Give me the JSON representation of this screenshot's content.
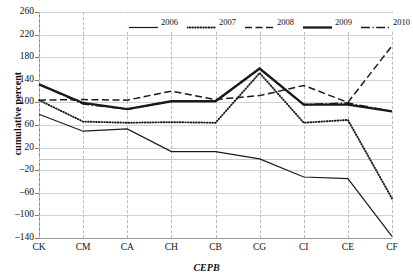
{
  "chart_data": {
    "type": "line",
    "title": "",
    "xlabel": "CEPB",
    "ylabel": "cumulative percent",
    "categories": [
      "CK",
      "CM",
      "CA",
      "CH",
      "CB",
      "CG",
      "CI",
      "CE",
      "CF"
    ],
    "ylim": [
      -140,
      260
    ],
    "yticks": [
      260,
      220,
      180,
      140,
      100,
      60,
      20,
      -20,
      -60,
      -100,
      -140
    ],
    "grid": "horizontal-solid-and-vertical-dashed",
    "legend_position": "top-center",
    "series": [
      {
        "name": "2006",
        "style": "solid-thin",
        "color": "#1a1a1a",
        "values": [
          79,
          49,
          53,
          13,
          13,
          0,
          -32,
          -35,
          -137
        ]
      },
      {
        "name": "2007",
        "style": "dotted",
        "color": "#1a1a1a",
        "values": [
          104,
          66,
          64,
          65,
          64,
          152,
          64,
          69,
          -70
        ]
      },
      {
        "name": "2008",
        "style": "dashed",
        "color": "#1a1a1a",
        "values": [
          104,
          105,
          104,
          120,
          105,
          112,
          130,
          100,
          200
        ]
      },
      {
        "name": "2009",
        "style": "solid-thick",
        "color": "#1a1a1a",
        "values": [
          132,
          99,
          88,
          102,
          102,
          160,
          96,
          96,
          84
        ]
      },
      {
        "name": "2010",
        "style": "dash-dot",
        "color": "#1a1a1a",
        "values": [
          132,
          97,
          88,
          102,
          102,
          160,
          96,
          99,
          84
        ]
      }
    ]
  }
}
